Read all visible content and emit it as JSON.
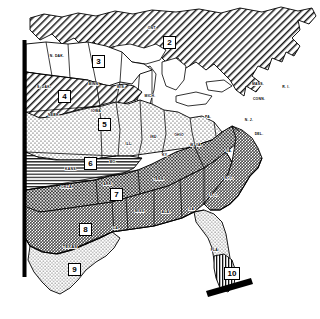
{
  "figure": {
    "kind": "map",
    "title": ""
  },
  "map": {
    "region": "Central and Eastern United States",
    "zone_count": 10,
    "zones": [
      {
        "id": "2",
        "label": "2",
        "pattern": "diagonal-hatch",
        "x": 169,
        "y": 42,
        "tone": "#ffffff"
      },
      {
        "id": "3",
        "label": "3",
        "pattern": "white",
        "x": 98,
        "y": 61,
        "tone": "#ffffff"
      },
      {
        "id": "4",
        "label": "4",
        "pattern": "diagonal-hatch",
        "x": 64,
        "y": 96,
        "tone": "#ffffff"
      },
      {
        "id": "5",
        "label": "5",
        "pattern": "light-stipple",
        "x": 104,
        "y": 124,
        "tone": "#ffffff"
      },
      {
        "id": "6",
        "label": "6",
        "pattern": "horizontal-lines",
        "x": 90,
        "y": 163,
        "tone": "#ffffff"
      },
      {
        "id": "7",
        "label": "7",
        "pattern": "dark-cross-hatch",
        "x": 116,
        "y": 194,
        "tone": "#555555"
      },
      {
        "id": "8",
        "label": "8",
        "pattern": "medium-gray",
        "x": 85,
        "y": 229,
        "tone": "#9a9a9a"
      },
      {
        "id": "9",
        "label": "9",
        "pattern": "light-stipple",
        "x": 74,
        "y": 269,
        "tone": "#ffffff"
      },
      {
        "id": "10",
        "label": "10",
        "pattern": "vertical-lines",
        "x": 231,
        "y": 273,
        "tone": "#ffffff"
      }
    ],
    "state_labels": [
      {
        "name": "ONT.",
        "x": 152,
        "y": 29
      },
      {
        "name": "N. DAK.",
        "x": 57,
        "y": 57
      },
      {
        "name": "MINN.",
        "x": 94,
        "y": 85
      },
      {
        "name": "S. DAK.",
        "x": 44,
        "y": 88
      },
      {
        "name": "WIS.",
        "x": 121,
        "y": 88
      },
      {
        "name": "MICH.",
        "x": 150,
        "y": 97
      },
      {
        "name": "NEBR.",
        "x": 54,
        "y": 116
      },
      {
        "name": "IOWA",
        "x": 96,
        "y": 112
      },
      {
        "name": "ILL.",
        "x": 129,
        "y": 145
      },
      {
        "name": "IND.",
        "x": 154,
        "y": 138
      },
      {
        "name": "OHIO",
        "x": 179,
        "y": 136
      },
      {
        "name": "PA.",
        "x": 208,
        "y": 118
      },
      {
        "name": "MASS.",
        "x": 258,
        "y": 85
      },
      {
        "name": "R. I.",
        "x": 286,
        "y": 88
      },
      {
        "name": "CONN.",
        "x": 259,
        "y": 100
      },
      {
        "name": "N. J.",
        "x": 249,
        "y": 121
      },
      {
        "name": "DEL.",
        "x": 259,
        "y": 135
      },
      {
        "name": "W. VA.",
        "x": 196,
        "y": 146
      },
      {
        "name": "KY.",
        "x": 165,
        "y": 156
      },
      {
        "name": "MO.",
        "x": 113,
        "y": 163
      },
      {
        "name": "KANS.",
        "x": 71,
        "y": 170
      },
      {
        "name": "OKLA.",
        "x": 67,
        "y": 188
      },
      {
        "name": "ARK.",
        "x": 108,
        "y": 185
      },
      {
        "name": "TENN.",
        "x": 159,
        "y": 180
      },
      {
        "name": "VA.",
        "x": 229,
        "y": 152
      },
      {
        "name": "N. C.",
        "x": 229,
        "y": 179
      },
      {
        "name": "S. C.",
        "x": 214,
        "y": 196
      },
      {
        "name": "MISS.",
        "x": 140,
        "y": 212
      },
      {
        "name": "ALA.",
        "x": 166,
        "y": 213
      },
      {
        "name": "GA.",
        "x": 192,
        "y": 210
      },
      {
        "name": "LA.",
        "x": 116,
        "y": 229
      },
      {
        "name": "TEXAS",
        "x": 70,
        "y": 247
      },
      {
        "name": "FLA.",
        "x": 215,
        "y": 251
      }
    ],
    "cut_bars": [
      {
        "name": "left-edge-cut-bar",
        "orientation": "vertical"
      },
      {
        "name": "florida-base-cut-bar",
        "orientation": "diagonal"
      }
    ]
  }
}
